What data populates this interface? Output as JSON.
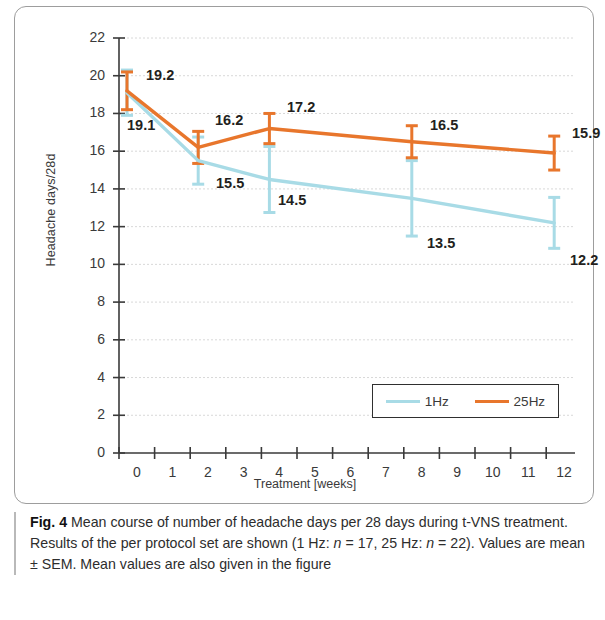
{
  "figure": {
    "caption_label": "Fig. 4",
    "caption_text_1": " Mean course of number of headache days per 28 days during t-VNS treatment. Results of the per protocol set are shown (1 Hz: ",
    "caption_n1": "n",
    "caption_text_2": " = 17, 25 Hz: ",
    "caption_n2": "n",
    "caption_text_3": " = 22). Values are mean ± SEM. Mean values are also given in the figure"
  },
  "colors": {
    "series_1hz": "#a8dbe6",
    "series_25hz": "#e8762c",
    "axis": "#3a3a3a",
    "grid": "#d8d8d8",
    "label_text": "#231f20"
  },
  "chart_data": {
    "type": "line",
    "title": "",
    "xlabel": "Treatment [weeks]",
    "ylabel": "Headache days/28d",
    "x": [
      0,
      2,
      4,
      8,
      12
    ],
    "xlim": [
      0,
      12
    ],
    "ylim": [
      0,
      22
    ],
    "ytick_step": 2,
    "xtick_labels": [
      "0",
      "1",
      "2",
      "3",
      "4",
      "5",
      "6",
      "7",
      "8",
      "9",
      "10",
      "11",
      "12"
    ],
    "ytick_labels": [
      "0",
      "2",
      "4",
      "6",
      "8",
      "10",
      "12",
      "14",
      "16",
      "18",
      "20",
      "22"
    ],
    "grid": "horizontal",
    "legend_position": "inside-lower-right",
    "series": [
      {
        "name": "1Hz",
        "color": "#a8dbe6",
        "values": [
          19.1,
          15.5,
          14.5,
          13.5,
          12.2
        ],
        "errors": [
          1.2,
          1.25,
          1.75,
          2.0,
          1.35
        ],
        "point_labels": [
          "19.1",
          "15.5",
          "14.5",
          "13.5",
          "12.2"
        ]
      },
      {
        "name": "25Hz",
        "color": "#e8762c",
        "values": [
          19.2,
          16.2,
          17.2,
          16.5,
          15.9
        ],
        "errors": [
          1.0,
          0.85,
          0.8,
          0.85,
          0.9
        ],
        "point_labels": [
          "19.2",
          "16.2",
          "17.2",
          "16.5",
          "15.9"
        ]
      }
    ]
  },
  "annotations": [
    {
      "text": "19.2",
      "x": 131,
      "y": 60
    },
    {
      "text": "19.1",
      "x": 112,
      "y": 110
    },
    {
      "text": "16.2",
      "x": 200,
      "y": 105
    },
    {
      "text": "15.5",
      "x": 201,
      "y": 168
    },
    {
      "text": "17.2",
      "x": 272,
      "y": 92
    },
    {
      "text": "14.5",
      "x": 263,
      "y": 185
    },
    {
      "text": "16.5",
      "x": 415,
      "y": 110
    },
    {
      "text": "13.5",
      "x": 412,
      "y": 228
    },
    {
      "text": "15.9",
      "x": 557,
      "y": 118
    },
    {
      "text": "12.2",
      "x": 555,
      "y": 245
    }
  ],
  "legend": {
    "entries": [
      {
        "label": "1Hz",
        "color": "#a8dbe6"
      },
      {
        "label": "25Hz",
        "color": "#e8762c"
      }
    ]
  }
}
